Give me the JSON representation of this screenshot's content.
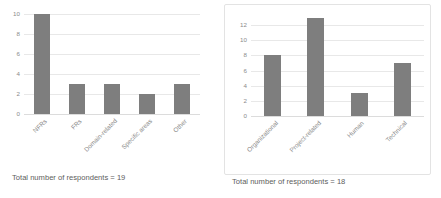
{
  "chart_data": [
    {
      "id": "left",
      "type": "bar",
      "title": "",
      "xlabel": "",
      "ylabel": "",
      "categories": [
        "NFRs",
        "FRs",
        "Domain-related",
        "Specific areas",
        "Other"
      ],
      "values": [
        10,
        3,
        3,
        2,
        3
      ],
      "yticks": [
        0,
        2,
        4,
        6,
        8,
        10
      ],
      "ylim": [
        0,
        10
      ],
      "grid": true,
      "legend": false,
      "bar_color": "#7e7e7e",
      "caption": "Total number of respondents = 19",
      "bordered": false
    },
    {
      "id": "right",
      "type": "bar",
      "title": "",
      "xlabel": "",
      "ylabel": "",
      "categories": [
        "Organizational",
        "Project-related",
        "Human",
        "Technical"
      ],
      "values": [
        8,
        13,
        3,
        7
      ],
      "yticks": [
        0,
        2,
        4,
        6,
        8,
        10,
        12
      ],
      "ylim": [
        0,
        13.6
      ],
      "grid": true,
      "legend": false,
      "bar_color": "#7e7e7e",
      "caption": "Total number of respondents = 18",
      "bordered": true
    }
  ]
}
